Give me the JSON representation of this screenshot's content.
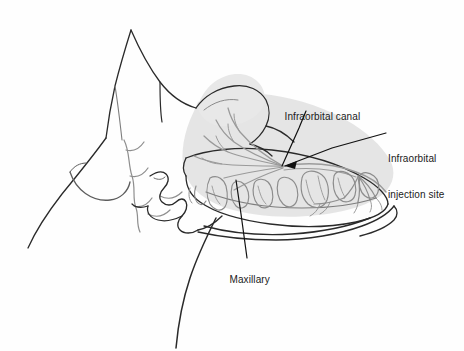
{
  "figure": {
    "background_color": "#fefefe",
    "line_color": "#1a1a1a",
    "bone_fill_color": "#e2e2e2",
    "nerve_color": "#9a9a9a",
    "tooth_outline_color": "#8c8c8c",
    "text_color": "#1a1a1a"
  },
  "labels": [
    {
      "id": "infraorbital-canal",
      "text": "Infraorbital canal",
      "lines": [
        "Infraorbital canal"
      ]
    },
    {
      "id": "infraorbital-injection-site",
      "text": "Infraorbital injection site",
      "lines": [
        "Infraorbital",
        "injection site"
      ]
    },
    {
      "id": "maxillary",
      "text": "Maxillary",
      "lines": [
        "Maxillary"
      ]
    }
  ],
  "label_text": {
    "infraorbital_canal": "Infraorbital canal",
    "injection_site_line1": "Infraorbital",
    "injection_site_line2": "injection site",
    "maxillary": "Maxillary"
  },
  "leader_lines": [
    {
      "id": "leader-infraorbital-canal",
      "from_label": "infraorbital-canal",
      "points": "305,111 299,126 281,166",
      "arrow": false
    },
    {
      "id": "leader-injection-site",
      "from_label": "infraorbital-injection-site",
      "points": "386,133 331,147 287,166",
      "arrow": true
    },
    {
      "id": "leader-maxillary",
      "from_label": "maxillary",
      "points": "247,258 241,214 236,180",
      "arrow": false
    }
  ],
  "anatomy_parts": [
    {
      "id": "ear-pinna",
      "name": "Ear (pinna)"
    },
    {
      "id": "head-profile",
      "name": "Head profile outline"
    },
    {
      "id": "eye",
      "name": "Eye"
    },
    {
      "id": "nose-muzzle",
      "name": "Nose and muzzle profile"
    },
    {
      "id": "skull-maxilla",
      "name": "Skull and maxilla (shaded)"
    },
    {
      "id": "zygomatic-arch",
      "name": "Zygomatic arch"
    },
    {
      "id": "mandible",
      "name": "Mandible"
    },
    {
      "id": "dental-arcade",
      "name": "Upper dental arcade"
    },
    {
      "id": "infraorbital-canal-path",
      "name": "Infraorbital canal"
    },
    {
      "id": "nerve-branches",
      "name": "Infraorbital nerve branches"
    },
    {
      "id": "neck-outline",
      "name": "Neck outline"
    }
  ]
}
